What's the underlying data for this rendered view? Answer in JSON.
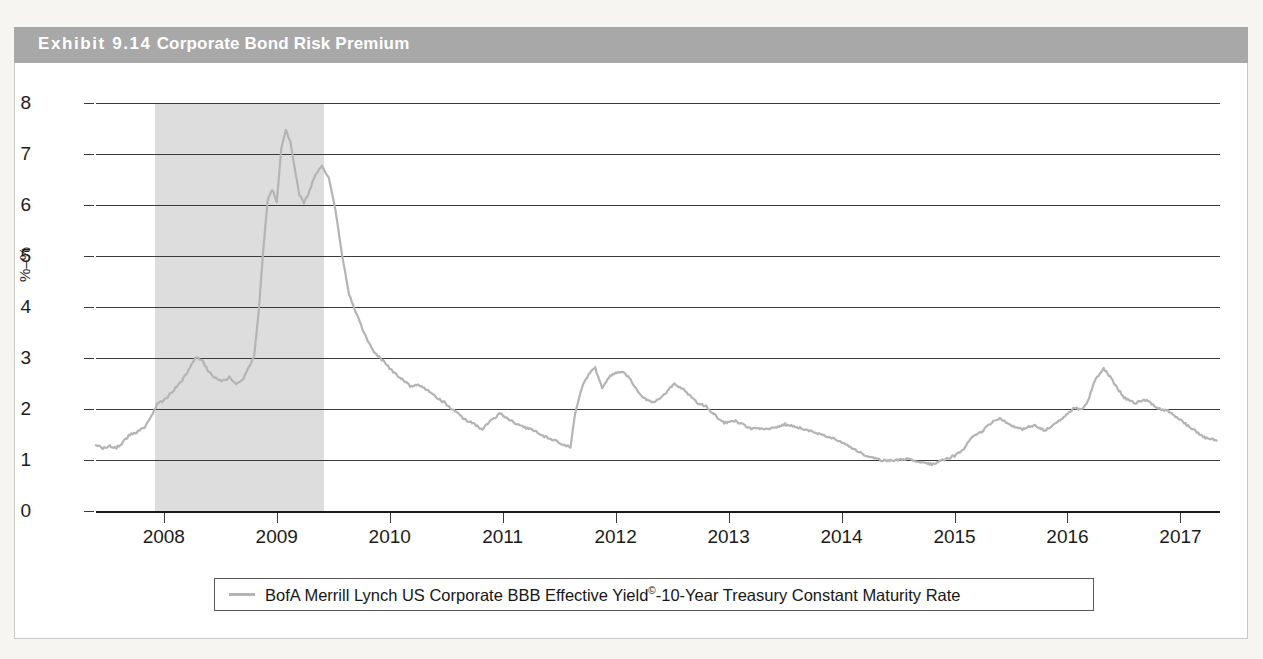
{
  "exhibit": {
    "number": "Exhibit 9.14",
    "title": "Corporate Bond Risk Premium",
    "banner_color": "#a8a8a8"
  },
  "legend": {
    "series_label_main": "BofA Merrill Lynch US Corporate BBB Effective Yield",
    "series_label_sup": "©",
    "series_label_tail": "-10-Year Treasury Constant Maturity Rate",
    "swatch_color": "#b4b4b4"
  },
  "axes": {
    "y_label": "%–%",
    "y_ticks": [
      "0",
      "1",
      "2",
      "3",
      "4",
      "5",
      "6",
      "7",
      "8"
    ],
    "x_ticks": [
      "2008",
      "2009",
      "2010",
      "2011",
      "2012",
      "2013",
      "2014",
      "2015",
      "2016",
      "2017"
    ]
  },
  "chart_data": {
    "type": "line",
    "title": "Corporate Bond Risk Premium",
    "xlabel": "",
    "ylabel": "%–%",
    "ylim": [
      0,
      8
    ],
    "xlim": [
      2007.4,
      2017.35
    ],
    "grid": true,
    "legend_position": "bottom",
    "shaded_regions": [
      {
        "label": "recession",
        "x_start": 2007.92,
        "x_end": 2009.42,
        "color": "#dddddd"
      }
    ],
    "series": [
      {
        "name": "BofA Merrill Lynch US Corporate BBB Effective Yield©-10-Year Treasury Constant Maturity Rate",
        "color": "#b4b4b4",
        "x": [
          2007.4,
          2007.46,
          2007.52,
          2007.58,
          2007.64,
          2007.7,
          2007.76,
          2007.82,
          2007.88,
          2007.94,
          2008.0,
          2008.08,
          2008.16,
          2008.22,
          2008.28,
          2008.34,
          2008.4,
          2008.46,
          2008.52,
          2008.58,
          2008.64,
          2008.7,
          2008.76,
          2008.8,
          2008.84,
          2008.88,
          2008.92,
          2008.96,
          2009.0,
          2009.04,
          2009.08,
          2009.12,
          2009.16,
          2009.2,
          2009.24,
          2009.28,
          2009.34,
          2009.4,
          2009.46,
          2009.52,
          2009.58,
          2009.64,
          2009.7,
          2009.78,
          2009.86,
          2009.94,
          2010.02,
          2010.1,
          2010.18,
          2010.26,
          2010.34,
          2010.42,
          2010.5,
          2010.58,
          2010.66,
          2010.74,
          2010.82,
          2010.9,
          2010.98,
          2011.06,
          2011.14,
          2011.22,
          2011.3,
          2011.38,
          2011.46,
          2011.54,
          2011.6,
          2011.64,
          2011.7,
          2011.76,
          2011.82,
          2011.88,
          2011.94,
          2012.0,
          2012.06,
          2012.12,
          2012.18,
          2012.26,
          2012.34,
          2012.4,
          2012.46,
          2012.52,
          2012.58,
          2012.64,
          2012.72,
          2012.8,
          2012.88,
          2012.96,
          2013.04,
          2013.12,
          2013.2,
          2013.3,
          2013.4,
          2013.5,
          2013.6,
          2013.7,
          2013.8,
          2013.9,
          2014.0,
          2014.1,
          2014.2,
          2014.3,
          2014.4,
          2014.5,
          2014.6,
          2014.7,
          2014.8,
          2014.9,
          2015.0,
          2015.08,
          2015.16,
          2015.24,
          2015.32,
          2015.4,
          2015.5,
          2015.6,
          2015.7,
          2015.8,
          2015.9,
          2016.0,
          2016.06,
          2016.12,
          2016.18,
          2016.24,
          2016.32,
          2016.4,
          2016.5,
          2016.6,
          2016.7,
          2016.8,
          2016.9,
          2017.0,
          2017.1,
          2017.2,
          2017.32
        ],
        "y": [
          1.3,
          1.22,
          1.28,
          1.24,
          1.35,
          1.5,
          1.55,
          1.62,
          1.8,
          2.1,
          2.16,
          2.35,
          2.55,
          2.75,
          3.02,
          2.95,
          2.72,
          2.6,
          2.55,
          2.62,
          2.5,
          2.58,
          2.85,
          3.05,
          3.9,
          5.1,
          6.1,
          6.3,
          6.05,
          7.1,
          7.48,
          7.25,
          6.7,
          6.2,
          6.05,
          6.2,
          6.6,
          6.75,
          6.55,
          5.9,
          5.0,
          4.25,
          3.9,
          3.45,
          3.1,
          2.95,
          2.75,
          2.6,
          2.45,
          2.48,
          2.35,
          2.22,
          2.1,
          1.95,
          1.8,
          1.72,
          1.6,
          1.78,
          1.92,
          1.78,
          1.7,
          1.62,
          1.55,
          1.45,
          1.38,
          1.3,
          1.25,
          1.9,
          2.42,
          2.68,
          2.8,
          2.42,
          2.62,
          2.7,
          2.72,
          2.62,
          2.4,
          2.2,
          2.12,
          2.22,
          2.35,
          2.5,
          2.42,
          2.3,
          2.12,
          2.05,
          1.88,
          1.72,
          1.78,
          1.7,
          1.62,
          1.6,
          1.62,
          1.7,
          1.65,
          1.58,
          1.52,
          1.45,
          1.35,
          1.22,
          1.1,
          1.02,
          0.98,
          1.0,
          1.02,
          0.95,
          0.92,
          1.0,
          1.08,
          1.22,
          1.45,
          1.55,
          1.72,
          1.82,
          1.68,
          1.6,
          1.68,
          1.58,
          1.72,
          1.9,
          2.02,
          1.98,
          2.15,
          2.55,
          2.8,
          2.55,
          2.22,
          2.12,
          2.18,
          2.02,
          1.95,
          1.78,
          1.62,
          1.45,
          1.38
        ]
      }
    ]
  }
}
